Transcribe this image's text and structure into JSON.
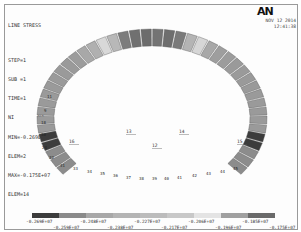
{
  "header": {
    "title": "LINE STRESS",
    "lines": [
      "STEP=1",
      "SUB =1",
      "TIME=1",
      "NI        NJ",
      "MIN=-0.269E+07",
      "ELEM=2",
      "MAX=-0.175E+07",
      "ELEM=14"
    ]
  },
  "logo": "AN",
  "timestamp": {
    "date": "NOV 12 2014",
    "time": "12:41:38"
  },
  "inner_labels": [
    {
      "text": "16",
      "x": 69,
      "y": 143
    },
    {
      "text": "13",
      "x": 126,
      "y": 133
    },
    {
      "text": "14",
      "x": 179,
      "y": 133
    },
    {
      "text": "12",
      "x": 152,
      "y": 147
    },
    {
      "text": "15",
      "x": 237,
      "y": 143
    }
  ],
  "element_labels": [
    {
      "text": "11",
      "x": 47,
      "y": 98
    },
    {
      "text": "9",
      "x": 44,
      "y": 112
    },
    {
      "text": "18",
      "x": 41,
      "y": 124
    },
    {
      "text": "30",
      "x": 41,
      "y": 136
    },
    {
      "text": "24",
      "x": 42,
      "y": 149
    },
    {
      "text": "32",
      "x": 49,
      "y": 159
    },
    {
      "text": "31",
      "x": 60,
      "y": 167
    },
    {
      "text": "33",
      "x": 73,
      "y": 170
    },
    {
      "text": "34",
      "x": 87,
      "y": 173
    },
    {
      "text": "35",
      "x": 100,
      "y": 175
    },
    {
      "text": "36",
      "x": 113,
      "y": 177
    },
    {
      "text": "37",
      "x": 126,
      "y": 179
    },
    {
      "text": "38",
      "x": 139,
      "y": 180
    },
    {
      "text": "39",
      "x": 152,
      "y": 180
    },
    {
      "text": "40",
      "x": 164,
      "y": 180
    },
    {
      "text": "41",
      "x": 177,
      "y": 179
    },
    {
      "text": "42",
      "x": 192,
      "y": 177
    },
    {
      "text": "43",
      "x": 206,
      "y": 175
    },
    {
      "text": "44",
      "x": 220,
      "y": 173
    },
    {
      "text": "45",
      "x": 233,
      "y": 170
    }
  ],
  "legend": {
    "colors": [
      "#3c3c3c",
      "#8a8a8a",
      "#a8a8a8",
      "#b4b4b4",
      "#bcbcbc",
      "#c8c8c8",
      "#e4e4e4",
      "#a0a0a0",
      "#6a6a6a"
    ],
    "top_labels": [
      "-0.269E+07",
      "-0.248E+07",
      "-0.227E+07",
      "-0.206E+07",
      "-0.185E+07"
    ],
    "bottom_labels": [
      "-0.259E+07",
      "-0.238E+07",
      "-0.217E+07",
      "-0.196E+07",
      "-0.175E+07"
    ]
  }
}
